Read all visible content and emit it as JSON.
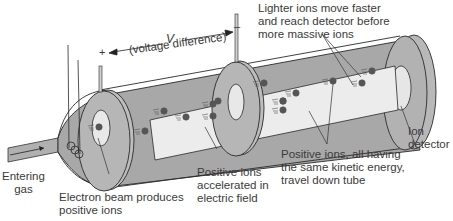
{
  "diagram": {
    "type": "time-of-flight mass spectrometer",
    "voltage": {
      "symbol": "V",
      "description": "(voltage difference)",
      "plus_sign": "+",
      "minus_sign": "–"
    },
    "labels": {
      "entering_gas_line1": "Entering",
      "entering_gas_line2": "gas",
      "electron_beam_line1": "Electron beam produces",
      "electron_beam_line2": "positive ions",
      "accelerated_line1": "Positive ions",
      "accelerated_line2": "accelerated in",
      "accelerated_line3": "electric field",
      "travel_line1": "Positive ions, all having",
      "travel_line2": "the same kinetic energy,",
      "travel_line3": "travel down tube",
      "lighter_line1": "Lighter ions move faster",
      "lighter_line2": "and reach detector before",
      "lighter_line3": "more massive ions",
      "detector_line1": "Ion",
      "detector_line2": "detector"
    },
    "colors": {
      "tube_outer": "#a9a9a9",
      "tube_inner": "#ececec",
      "plate": "#b5b5b5",
      "ion": "#555555",
      "outline": "#2a2a2a",
      "text": "#3a3a3a"
    }
  }
}
